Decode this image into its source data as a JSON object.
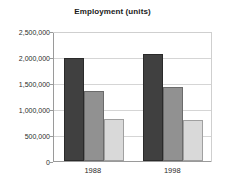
{
  "chart_data": {
    "type": "bar",
    "title": "Employment (units)",
    "xlabel": "",
    "ylabel": "",
    "categories": [
      "1988",
      "1998"
    ],
    "series": [
      {
        "name": "series-1",
        "color": "#404040",
        "values": [
          1980000,
          2050000
        ]
      },
      {
        "name": "series-2",
        "color": "#919191",
        "values": [
          1350000,
          1420000
        ]
      },
      {
        "name": "series-3",
        "color": "#d9d9d9",
        "values": [
          810000,
          780000
        ]
      }
    ],
    "ylim": [
      0,
      2500000
    ],
    "ytick_values": [
      0,
      500000,
      1000000,
      1500000,
      2000000,
      2500000
    ],
    "ytick_labels": [
      "0",
      "500,000",
      "1,000,000",
      "1,500,000",
      "2,000,000",
      "2,500,000"
    ],
    "grid": true,
    "legend": false,
    "legend_position": "none"
  }
}
